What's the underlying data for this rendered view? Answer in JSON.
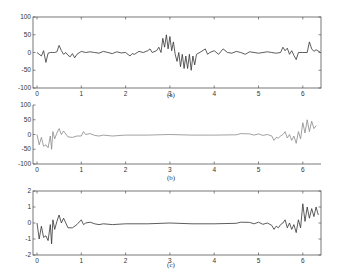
{
  "chart_data": [
    {
      "type": "line",
      "caption": "(a)",
      "frame": "box",
      "line_color": "#333333",
      "xlim": [
        0,
        6.4
      ],
      "ylim": [
        -100,
        100
      ],
      "xticks": [
        "0",
        "1",
        "2",
        "3",
        "4",
        "5",
        "6"
      ],
      "yticks": [
        "100",
        "50",
        "0",
        "-50",
        "-100"
      ],
      "series": [
        {
          "name": "a",
          "x": [
            0,
            0.05,
            0.1,
            0.15,
            0.2,
            0.25,
            0.3,
            0.35,
            0.4,
            0.45,
            0.5,
            0.55,
            0.6,
            0.65,
            0.7,
            0.75,
            0.8,
            0.85,
            0.9,
            1.0,
            1.1,
            1.2,
            1.3,
            1.4,
            1.5,
            1.6,
            1.7,
            1.8,
            1.9,
            2.0,
            2.1,
            2.15,
            2.2,
            2.3,
            2.4,
            2.5,
            2.55,
            2.6,
            2.7,
            2.75,
            2.8,
            2.84,
            2.88,
            2.92,
            2.96,
            3.0,
            3.04,
            3.08,
            3.12,
            3.16,
            3.2,
            3.24,
            3.28,
            3.32,
            3.36,
            3.4,
            3.44,
            3.48,
            3.52,
            3.56,
            3.6,
            3.7,
            3.8,
            3.85,
            3.9,
            4.0,
            4.1,
            4.2,
            4.3,
            4.4,
            4.5,
            4.6,
            4.7,
            4.8,
            4.9,
            5.0,
            5.1,
            5.2,
            5.3,
            5.4,
            5.5,
            5.55,
            5.6,
            5.65,
            5.7,
            5.75,
            5.8,
            5.85,
            5.9,
            6.0,
            6.1,
            6.15,
            6.2,
            6.25,
            6.3,
            6.4
          ],
          "y": [
            0,
            -5,
            -10,
            5,
            -28,
            -2,
            0,
            0,
            0,
            2,
            20,
            5,
            -5,
            0,
            -8,
            -12,
            -3,
            -15,
            -5,
            3,
            0,
            2,
            0,
            -2,
            3,
            0,
            -3,
            2,
            -1,
            0,
            -10,
            -3,
            -5,
            3,
            0,
            5,
            10,
            0,
            5,
            15,
            0,
            40,
            15,
            50,
            10,
            45,
            5,
            30,
            -5,
            -25,
            0,
            -40,
            -5,
            -45,
            -10,
            -45,
            -5,
            -50,
            -10,
            -35,
            -5,
            2,
            10,
            -5,
            0,
            5,
            -5,
            10,
            0,
            -2,
            3,
            0,
            -5,
            2,
            0,
            -2,
            0,
            2,
            0,
            -2,
            0,
            15,
            5,
            12,
            -5,
            5,
            -8,
            -20,
            0,
            0,
            0,
            30,
            10,
            3,
            8,
            0
          ]
        }
      ]
    },
    {
      "type": "line",
      "caption": "(b)",
      "frame": "left-bottom",
      "line_color": "#8a8a8a",
      "xlim": [
        0,
        6.4
      ],
      "ylim": [
        -100,
        100
      ],
      "xticks": [
        "0",
        "1",
        "2",
        "3",
        "4",
        "5",
        "6"
      ],
      "yticks": [
        "100",
        "50",
        "0",
        "-50",
        "-100"
      ],
      "series": [
        {
          "name": "b",
          "x": [
            0,
            0.05,
            0.1,
            0.15,
            0.2,
            0.25,
            0.3,
            0.33,
            0.36,
            0.4,
            0.45,
            0.5,
            0.55,
            0.6,
            0.7,
            0.8,
            0.9,
            1.0,
            1.05,
            1.1,
            1.2,
            1.3,
            1.4,
            1.5,
            1.7,
            2.0,
            2.5,
            3.0,
            3.5,
            4.0,
            4.5,
            4.6,
            4.8,
            4.9,
            5.0,
            5.1,
            5.2,
            5.3,
            5.35,
            5.4,
            5.45,
            5.5,
            5.55,
            5.6,
            5.65,
            5.7,
            5.75,
            5.8,
            5.85,
            5.9,
            5.95,
            6.0,
            6.05,
            6.1,
            6.15,
            6.2,
            6.25,
            6.3
          ],
          "y": [
            0,
            -35,
            -10,
            -40,
            -35,
            -45,
            -5,
            -50,
            10,
            -15,
            5,
            20,
            0,
            12,
            -8,
            -10,
            -5,
            -5,
            10,
            0,
            3,
            -3,
            -5,
            -2,
            -5,
            -2,
            -2,
            0,
            -2,
            -2,
            -1,
            3,
            2,
            -2,
            2,
            -3,
            0,
            -5,
            -20,
            -10,
            -12,
            -5,
            0,
            10,
            -12,
            0,
            -20,
            -5,
            -30,
            10,
            -15,
            40,
            5,
            50,
            10,
            45,
            20,
            30
          ]
        }
      ]
    },
    {
      "type": "line",
      "caption": "(c)",
      "frame": "box",
      "line_color": "#333333",
      "xlim": [
        0,
        6.4
      ],
      "ylim": [
        -2,
        2
      ],
      "xticks": [
        "0",
        "1",
        "2",
        "3",
        "4",
        "5",
        "6"
      ],
      "yticks": [
        "2",
        "1",
        "0",
        "-1",
        "-2"
      ],
      "series": [
        {
          "name": "c",
          "x": [
            0,
            0.05,
            0.1,
            0.15,
            0.2,
            0.25,
            0.3,
            0.33,
            0.36,
            0.4,
            0.45,
            0.5,
            0.55,
            0.6,
            0.7,
            0.8,
            0.9,
            1.0,
            1.05,
            1.1,
            1.2,
            1.3,
            1.4,
            1.5,
            1.7,
            2.0,
            2.5,
            3.0,
            3.5,
            4.0,
            4.5,
            4.6,
            4.8,
            4.9,
            5.0,
            5.1,
            5.2,
            5.3,
            5.35,
            5.4,
            5.45,
            5.5,
            5.55,
            5.6,
            5.65,
            5.7,
            5.75,
            5.8,
            5.85,
            5.9,
            5.95,
            6.0,
            6.05,
            6.1,
            6.15,
            6.2,
            6.25,
            6.3,
            6.35
          ],
          "y": [
            0,
            -1,
            -0.2,
            -0.9,
            -0.8,
            -1.1,
            -0.1,
            -1.3,
            0.2,
            -0.4,
            0.1,
            0.5,
            0,
            0.3,
            -0.3,
            -0.3,
            -0.1,
            0.2,
            -0.1,
            0,
            0.05,
            -0.05,
            -0.1,
            -0.05,
            -0.1,
            -0.05,
            -0.05,
            0,
            -0.05,
            -0.05,
            -0.02,
            0.05,
            0.04,
            -0.05,
            0.05,
            -0.08,
            0,
            -0.15,
            -0.4,
            -0.2,
            -0.3,
            -0.1,
            0,
            0.2,
            -0.3,
            0,
            -0.4,
            -0.1,
            -0.6,
            0.2,
            -0.3,
            1.2,
            0.1,
            1,
            0.3,
            0.9,
            0.4,
            1,
            0.5
          ]
        }
      ]
    }
  ]
}
